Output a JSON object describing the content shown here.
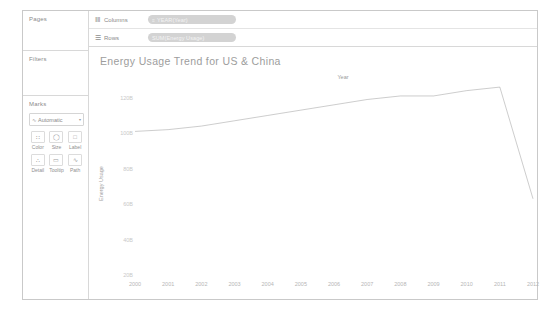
{
  "app": {
    "panel_background": "#ffffff",
    "border_color": "#c9c9c9"
  },
  "rail": {
    "pages": {
      "title": "Pages"
    },
    "filters": {
      "title": "Filters"
    },
    "marks": {
      "title": "Marks",
      "type_select": {
        "glyph": "mark-type-icon",
        "value": "Automatic",
        "caret": "▾"
      },
      "buttons": [
        {
          "name": "color",
          "label": "Color",
          "icon": "color-palette-icon",
          "glyph": "∷"
        },
        {
          "name": "size",
          "label": "Size",
          "icon": "size-circle-icon",
          "glyph": "◯"
        },
        {
          "name": "label",
          "label": "Label",
          "icon": "label-tag-icon",
          "glyph": "□"
        },
        {
          "name": "detail",
          "label": "Detail",
          "icon": "detail-icon",
          "glyph": "∴"
        },
        {
          "name": "tooltip",
          "label": "Tooltip",
          "icon": "tooltip-bubble-icon",
          "glyph": "▭"
        },
        {
          "name": "path",
          "label": "Path",
          "icon": "path-line-icon",
          "glyph": "∿"
        }
      ]
    }
  },
  "shelves": [
    {
      "name": "columns",
      "glyph": "columns-icon",
      "glyph_char": "‖‖",
      "label": "Columns",
      "pill": {
        "text": "YEAR(Year)",
        "glyph": "≡",
        "color": "#d3d3d3"
      }
    },
    {
      "name": "rows",
      "glyph": "rows-icon",
      "glyph_char": "☰",
      "label": "Rows",
      "pill": {
        "text": "SUM(Energy Usage)",
        "glyph": "",
        "color": "#d3d3d3"
      }
    }
  ],
  "chart_data": {
    "type": "line",
    "title": "Energy Usage Trend for US & China",
    "column_header": "Year",
    "xlabel": "",
    "ylabel": "Energy Usage",
    "x": [
      2000,
      2001,
      2002,
      2003,
      2004,
      2005,
      2006,
      2007,
      2008,
      2009,
      2010,
      2011,
      2012
    ],
    "categories": [
      "2000",
      "2001",
      "2002",
      "2003",
      "2004",
      "2005",
      "2006",
      "2007",
      "2008",
      "2009",
      "2010",
      "2011",
      "2012"
    ],
    "values": [
      101,
      102,
      104,
      107,
      110,
      113,
      116,
      119,
      121,
      121,
      124,
      126,
      63
    ],
    "ylim": [
      20,
      130
    ],
    "yticks": [
      120,
      100,
      80,
      60,
      40,
      20
    ],
    "ytick_labels": [
      "120B",
      "100B",
      "80B",
      "60B",
      "40B",
      "20B"
    ],
    "grid": false,
    "legend": "none",
    "line_color": "#6e6e6e",
    "line_width": 1,
    "series": [
      {
        "name": "SUM(Energy Usage)",
        "values": [
          101,
          102,
          104,
          107,
          110,
          113,
          116,
          119,
          121,
          121,
          124,
          126,
          63
        ]
      }
    ]
  }
}
